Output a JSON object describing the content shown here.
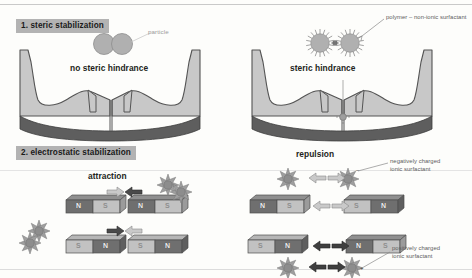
{
  "figure": {
    "title_visible": false,
    "background_color": "#fdfdfb",
    "sections": [
      {
        "id": "steric",
        "label": "1. steric stabilization",
        "tag_color": "#b3b3b3"
      },
      {
        "id": "electrostatic",
        "label": "2. electrostatic stabilization",
        "tag_color": "#b3b3b3"
      }
    ]
  },
  "panel_steric_left": {
    "caption": "no steric hindrance",
    "particle_label": "particle",
    "particle_count": 2,
    "particle_color": "#b0b0b0"
  },
  "panel_steric_right": {
    "caption": "steric hindrance",
    "polymer_label": "polymer – non-ionic surfactant",
    "particle_count": 2,
    "particle_color": "#b0b0b0"
  },
  "panel_electrostatic_left": {
    "caption": "attraction",
    "magnet_rows": [
      {
        "poles": [
          "N",
          "S",
          "N",
          "S"
        ]
      },
      {
        "poles": [
          "S",
          "N",
          "S",
          "N"
        ]
      }
    ],
    "arrow_pair": {
      "left": "➡",
      "right": "⬅",
      "meaning": "attraction"
    },
    "surfactant_count": 2
  },
  "panel_electrostatic_right": {
    "caption": "repulsion",
    "magnet_rows": [
      {
        "poles": [
          "N",
          "S",
          "S",
          "N"
        ]
      },
      {
        "poles": [
          "S",
          "N",
          "N",
          "S"
        ]
      }
    ],
    "arrow_pair": {
      "left": "⬅",
      "right": "➡",
      "meaning": "repulsion"
    },
    "callouts": [
      {
        "id": "negative",
        "text_line1": "negatively charged",
        "text_line2": "ionic surfactant",
        "charge": "−"
      },
      {
        "id": "positive",
        "text_line1": "positively charged",
        "text_line2": "ionic surfactant",
        "charge": "+"
      }
    ]
  },
  "palette": {
    "magnet_dark": "#6f6f6f",
    "magnet_light": "#c2c2c2",
    "magnet_edge": "#4f4f4f",
    "surface_fill": "#c8c8c8",
    "surface_base": "#5e5e5e",
    "surfactant_fill": "#9e9e9e",
    "arrow_dark": "#4a4a4a",
    "arrow_light": "#c9c9c9",
    "text": "#231f20"
  }
}
